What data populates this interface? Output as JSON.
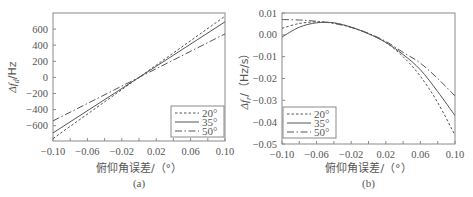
{
  "chart_data": [
    {
      "type": "line",
      "panel": "(a)",
      "caption": "(a)",
      "xlabel": "俯仰角误差/（°）",
      "ylabel": "Δf_d/Hz",
      "ylabel_main": "Δf",
      "ylabel_sub": "d",
      "ylabel_rest": "/Hz",
      "xlim": [
        -0.1,
        0.1
      ],
      "ylim": [
        -790,
        800
      ],
      "xticks": [
        -0.1,
        -0.06,
        -0.02,
        0.02,
        0.06,
        0.1
      ],
      "xtick_labels": [
        "−0.10",
        "−0.06",
        "−0.02",
        "0.02",
        "0.06",
        "0.10"
      ],
      "yticks": [
        600,
        400,
        200,
        0,
        -200,
        -400,
        -600
      ],
      "ytick_labels": [
        "600",
        "400",
        "200",
        "0",
        "−200",
        "−400",
        "−600"
      ],
      "grid": false,
      "legend_position": "lower right",
      "x": [
        -0.1,
        0.1
      ],
      "series": [
        {
          "name": "20°",
          "style": "dotted",
          "values": [
            -760,
            760
          ]
        },
        {
          "name": "35°",
          "style": "solid",
          "values": [
            -690,
            690
          ]
        },
        {
          "name": "50°",
          "style": "dashdot",
          "values": [
            -540,
            540
          ]
        }
      ]
    },
    {
      "type": "line",
      "panel": "(b)",
      "caption": "(b)",
      "xlabel": "俯仰角误差/（°）",
      "ylabel": "Δf_r/（Hz/s）",
      "ylabel_main": "Δf",
      "ylabel_sub": "r",
      "ylabel_rest": "/（Hz/s）",
      "xlim": [
        -0.1,
        0.1
      ],
      "ylim": [
        -0.05,
        0.01
      ],
      "xticks": [
        -0.1,
        -0.06,
        -0.02,
        0.02,
        0.06,
        0.1
      ],
      "xtick_labels": [
        "−0.10",
        "−0.06",
        "−0.02",
        "0.02",
        "0.06",
        "0.10"
      ],
      "yticks": [
        0.01,
        0.0,
        -0.01,
        -0.02,
        -0.03,
        -0.04,
        -0.05
      ],
      "ytick_labels": [
        "0.01",
        "0.00",
        "−0.01",
        "−0.02",
        "−0.03",
        "−0.04",
        "−0.05"
      ],
      "grid": false,
      "legend_position": "lower left",
      "x": [
        -0.1,
        -0.08,
        -0.06,
        -0.04,
        -0.02,
        0.0,
        0.02,
        0.04,
        0.06,
        0.08,
        0.1
      ],
      "series": [
        {
          "name": "20°",
          "style": "dotted",
          "values": [
            0.003,
            0.0052,
            0.0059,
            0.0054,
            0.0035,
            0.0005,
            -0.0035,
            -0.01,
            -0.019,
            -0.031,
            -0.046
          ]
        },
        {
          "name": "35°",
          "style": "solid",
          "values": [
            -0.001,
            0.0035,
            0.0055,
            0.0055,
            0.0035,
            0.0005,
            -0.0035,
            -0.009,
            -0.016,
            -0.026,
            -0.037
          ]
        },
        {
          "name": "50°",
          "style": "dashdot",
          "values": [
            0.007,
            0.0068,
            0.0062,
            0.0052,
            0.0034,
            0.0007,
            -0.003,
            -0.008,
            -0.013,
            -0.02,
            -0.028
          ]
        }
      ]
    }
  ],
  "colors": {
    "axis": "#8a8a8a",
    "line": "#555555",
    "text": "#555555"
  }
}
